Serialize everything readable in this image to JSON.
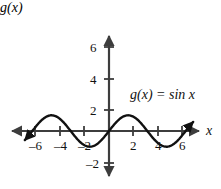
{
  "figure": {
    "title": "",
    "background_color": "#ffffff",
    "ink_color": "#1a1a1a",
    "axis_color": "#3d3d3d"
  },
  "labels": {
    "y_axis_name": "g(x)",
    "x_axis_name": "x",
    "function_label": "g(x) = sin x"
  },
  "ticks": {
    "x_negative": [
      "–6",
      "–4",
      "–2"
    ],
    "x_positive": [
      "2",
      "4",
      "6"
    ],
    "y_positive": [
      "2",
      "4",
      "6"
    ],
    "y_negative": [
      "–2"
    ]
  },
  "chart_data": {
    "type": "line",
    "title": "",
    "subtitle": "",
    "xlabel": "x",
    "ylabel": "g(x)",
    "xlim": [
      -7.2,
      7.2
    ],
    "ylim": [
      -2.8,
      7.2
    ],
    "grid": false,
    "legend": null,
    "annotations": [
      {
        "text": "g(x) = sin x",
        "x": 2.2,
        "y": 2.6
      }
    ],
    "xticks": [
      -6,
      -4,
      -2,
      2,
      4,
      6
    ],
    "xticklabels": [
      "–6",
      "–4",
      "–2",
      "2",
      "4",
      "6"
    ],
    "yticks": [
      -2,
      2,
      4,
      6
    ],
    "yticklabels": [
      "–2",
      "2",
      "4",
      "6"
    ],
    "axis_arrows": {
      "x_left": true,
      "x_right": true,
      "y_up": true,
      "y_down": true
    },
    "series": [
      {
        "name": "g(x) = sin x",
        "formula": "sin(x)",
        "amplitude": 1,
        "period": 6.283185307179586,
        "domain": [
          -6.9,
          6.9
        ],
        "arrow_start": true,
        "arrow_end": true,
        "color": "#111111",
        "linewidth": 2.4,
        "x": [
          -6.9,
          -6.5,
          -6.0,
          -5.5,
          -5.0,
          -4.71,
          -4.5,
          -4.0,
          -3.5,
          -3.14,
          -3.0,
          -2.5,
          -2.0,
          -1.57,
          -1.0,
          -0.5,
          0.0,
          0.5,
          1.0,
          1.57,
          2.0,
          2.5,
          3.0,
          3.14,
          3.5,
          4.0,
          4.5,
          4.71,
          5.0,
          5.5,
          6.0,
          6.28,
          6.5,
          6.9
        ],
        "y": [
          -0.58,
          -0.22,
          0.28,
          0.71,
          0.96,
          1.0,
          0.98,
          0.76,
          0.35,
          0.0,
          -0.14,
          -0.6,
          -0.91,
          -1.0,
          -0.84,
          -0.48,
          0.0,
          0.48,
          0.84,
          1.0,
          0.91,
          0.6,
          0.14,
          0.0,
          -0.35,
          -0.76,
          -0.98,
          -1.0,
          -0.96,
          -0.71,
          -0.28,
          0.0,
          0.22,
          0.58
        ]
      }
    ]
  }
}
